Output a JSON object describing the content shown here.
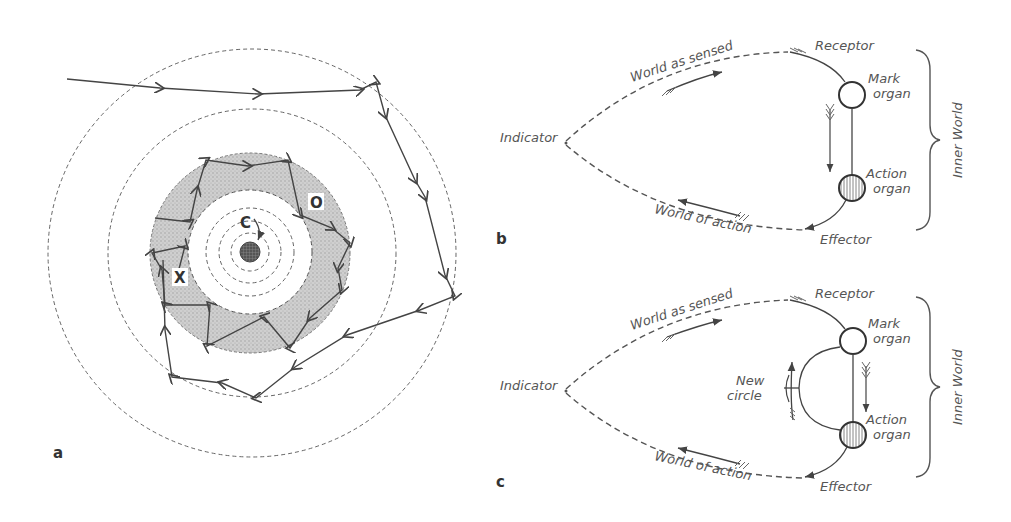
{
  "figure": {
    "panels": {
      "a": {
        "letter": "a",
        "labels": {
          "center": "C",
          "outer_point": "O",
          "cross_point": "X"
        }
      },
      "b": {
        "letter": "b",
        "labels": {
          "world_sensed": "World as sensed",
          "world_action": "World of action",
          "indicator": "Indicator",
          "receptor": "Receptor",
          "effector": "Effector",
          "mark_organ_1": "Mark",
          "mark_organ_2": "organ",
          "action_organ_1": "Action",
          "action_organ_2": "organ",
          "inner_world": "Inner World"
        }
      },
      "c": {
        "letter": "c",
        "labels": {
          "world_sensed": "World as sensed",
          "world_action": "World of action",
          "indicator": "Indicator",
          "receptor": "Receptor",
          "effector": "Effector",
          "mark_organ_1": "Mark",
          "mark_organ_2": "organ",
          "action_organ_1": "Action",
          "action_organ_2": "organ",
          "new_circle_1": "New",
          "new_circle_2": "circle",
          "inner_world": "Inner World"
        }
      }
    },
    "colors": {
      "line": "#444444",
      "shaded_ring": "#c8c8c8",
      "label_text": "#555555"
    }
  }
}
